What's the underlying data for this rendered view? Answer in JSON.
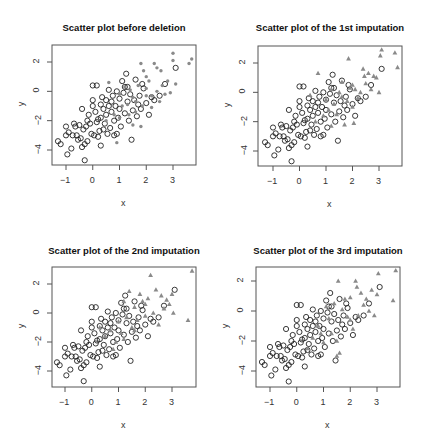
{
  "chart_data": [
    {
      "type": "scatter",
      "title": "Scatter plot before deletion",
      "xlabel": "x",
      "ylabel": "y",
      "xlim": [
        -1.4,
        3.9
      ],
      "ylim": [
        -5.0,
        3.1
      ],
      "xticks": [
        -1,
        0,
        1,
        2,
        3
      ],
      "yticks": [
        2,
        0,
        -2,
        -4
      ],
      "grid": false,
      "series": [
        {
          "name": "observed",
          "marker": "open-circle",
          "color": "#222222",
          "points": [
            [
              -1.3,
              -3.4
            ],
            [
              -1.2,
              -3.6
            ],
            [
              -1.0,
              -2.4
            ],
            [
              -1.0,
              -3.0
            ],
            [
              -0.9,
              -2.8
            ],
            [
              -0.95,
              -4.3
            ],
            [
              -0.8,
              -3.9
            ],
            [
              -0.75,
              -3.0
            ],
            [
              -0.7,
              -2.2
            ],
            [
              -0.65,
              -2.4
            ],
            [
              -0.6,
              -3.0
            ],
            [
              -0.55,
              -3.3
            ],
            [
              -0.5,
              -2.3
            ],
            [
              -0.45,
              -3.2
            ],
            [
              -0.4,
              -3.8
            ],
            [
              -0.4,
              -1.2
            ],
            [
              -0.35,
              -2.6
            ],
            [
              -0.3,
              -3.6
            ],
            [
              -0.3,
              -4.7
            ],
            [
              -0.25,
              -2.4
            ],
            [
              -0.2,
              -3.4
            ],
            [
              -0.15,
              -1.6
            ],
            [
              -0.1,
              -2.2
            ],
            [
              -0.05,
              -2.9
            ],
            [
              0.0,
              -0.6
            ],
            [
              0.0,
              -1.0
            ],
            [
              0.0,
              0.4
            ],
            [
              0.05,
              -3.0
            ],
            [
              0.1,
              -1.4
            ],
            [
              0.15,
              -2.1
            ],
            [
              0.15,
              0.4
            ],
            [
              0.2,
              -3.1
            ],
            [
              0.25,
              -2.7
            ],
            [
              0.3,
              -1.8
            ],
            [
              0.3,
              -0.9
            ],
            [
              0.3,
              -3.7
            ],
            [
              0.35,
              -0.4
            ],
            [
              0.4,
              -1.2
            ],
            [
              0.45,
              -2.2
            ],
            [
              0.5,
              -0.6
            ],
            [
              0.5,
              -1.6
            ],
            [
              0.55,
              -2.9
            ],
            [
              0.6,
              -1.0
            ],
            [
              0.6,
              0.1
            ],
            [
              0.65,
              -2.5
            ],
            [
              0.7,
              -1.4
            ],
            [
              0.75,
              -0.3
            ],
            [
              0.8,
              -2.0
            ],
            [
              0.85,
              -1.0
            ],
            [
              0.9,
              -2.9
            ],
            [
              0.9,
              0.0
            ],
            [
              0.95,
              -1.8
            ],
            [
              1.0,
              -0.5
            ],
            [
              1.0,
              -1.2
            ],
            [
              1.05,
              -2.4
            ],
            [
              1.1,
              0.7
            ],
            [
              1.15,
              -0.1
            ],
            [
              1.2,
              -1.5
            ],
            [
              1.25,
              1.2
            ],
            [
              1.3,
              -0.7
            ],
            [
              1.3,
              0.3
            ],
            [
              1.35,
              -2.0
            ],
            [
              1.4,
              -0.2
            ],
            [
              1.45,
              -3.3
            ],
            [
              1.5,
              -1.3
            ],
            [
              1.55,
              -0.6
            ],
            [
              1.6,
              0.8
            ],
            [
              1.65,
              -1.7
            ],
            [
              1.7,
              -0.9
            ],
            [
              1.75,
              -0.3
            ],
            [
              1.8,
              -1.2
            ],
            [
              1.85,
              0.5
            ],
            [
              1.9,
              0.2
            ],
            [
              2.0,
              -0.8
            ],
            [
              2.1,
              -1.6
            ],
            [
              2.2,
              -0.4
            ],
            [
              2.3,
              -0.6
            ],
            [
              2.5,
              -0.3
            ],
            [
              2.7,
              0.5
            ],
            [
              3.1,
              1.6
            ],
            [
              1.2,
              0.3
            ],
            [
              0.7,
              -0.7
            ],
            [
              0.2,
              -1.9
            ],
            [
              -0.2,
              -2.0
            ],
            [
              0.4,
              -2.6
            ],
            [
              0.8,
              -3.0
            ]
          ]
        },
        {
          "name": "deleted",
          "marker": "filled-dot",
          "color": "#8a8a8a",
          "points": [
            [
              0.6,
              0.6
            ],
            [
              0.8,
              -1.6
            ],
            [
              0.9,
              -3.5
            ],
            [
              1.0,
              -0.2
            ],
            [
              1.1,
              -1.0
            ],
            [
              1.2,
              0.3
            ],
            [
              1.3,
              -0.9
            ],
            [
              1.35,
              -1.6
            ],
            [
              1.4,
              0.1
            ],
            [
              1.5,
              -0.4
            ],
            [
              1.5,
              -2.3
            ],
            [
              1.6,
              -0.7
            ],
            [
              1.7,
              0.4
            ],
            [
              1.8,
              1.9
            ],
            [
              1.8,
              -2.4
            ],
            [
              1.85,
              -1.0
            ],
            [
              1.9,
              1.4
            ],
            [
              2.0,
              1.0
            ],
            [
              2.0,
              -0.3
            ],
            [
              2.1,
              0.7
            ],
            [
              2.2,
              -1.1
            ],
            [
              2.3,
              1.9
            ],
            [
              2.4,
              1.6
            ],
            [
              2.4,
              0.0
            ],
            [
              2.5,
              -0.7
            ],
            [
              2.55,
              1.4
            ],
            [
              2.6,
              0.4
            ],
            [
              2.7,
              -0.2
            ],
            [
              2.8,
              0.7
            ],
            [
              2.9,
              -0.1
            ],
            [
              3.0,
              2.6
            ],
            [
              3.0,
              2.1
            ],
            [
              3.1,
              0.5
            ],
            [
              3.6,
              1.9
            ],
            [
              3.7,
              2.2
            ],
            [
              2.2,
              -0.3
            ],
            [
              1.6,
              -1.4
            ],
            [
              1.0,
              -1.8
            ],
            [
              0.5,
              -2.0
            ],
            [
              2.0,
              0.2
            ]
          ]
        }
      ]
    },
    {
      "type": "scatter",
      "title": "Scatter plot of the 1st imputation",
      "xlabel": "x",
      "ylabel": "y",
      "xlim": [
        -1.4,
        3.9
      ],
      "ylim": [
        -5.0,
        3.1
      ],
      "xticks": [
        -1,
        0,
        1,
        2,
        3
      ],
      "yticks": [
        2,
        0,
        -2,
        -4
      ],
      "grid": false,
      "series": [
        {
          "name": "observed",
          "marker": "open-circle",
          "color": "#222222",
          "points_ref": "observed"
        },
        {
          "name": "imputed",
          "marker": "triangle",
          "color": "#8a8a8a",
          "points": [
            [
              0.7,
              1.3
            ],
            [
              1.0,
              -0.5
            ],
            [
              1.1,
              -1.2
            ],
            [
              1.2,
              0.2
            ],
            [
              1.3,
              -0.8
            ],
            [
              1.4,
              -1.5
            ],
            [
              1.5,
              0.0
            ],
            [
              1.6,
              -0.3
            ],
            [
              1.7,
              -2.2
            ],
            [
              1.8,
              -0.6
            ],
            [
              1.85,
              2.3
            ],
            [
              1.9,
              0.3
            ],
            [
              2.0,
              -1.0
            ],
            [
              2.05,
              -2.1
            ],
            [
              2.1,
              0.2
            ],
            [
              2.2,
              -0.4
            ],
            [
              2.3,
              0.0
            ],
            [
              2.4,
              1.6
            ],
            [
              2.45,
              1.1
            ],
            [
              2.5,
              0.6
            ],
            [
              2.6,
              1.3
            ],
            [
              2.7,
              0.2
            ],
            [
              2.8,
              1.1
            ],
            [
              2.9,
              1.0
            ],
            [
              3.0,
              0.0
            ],
            [
              3.05,
              2.5
            ],
            [
              3.1,
              2.9
            ],
            [
              3.6,
              2.7
            ],
            [
              3.7,
              1.7
            ],
            [
              0.9,
              -1.6
            ],
            [
              0.6,
              -2.0
            ],
            [
              1.2,
              -2.3
            ],
            [
              0.4,
              -0.2
            ],
            [
              1.6,
              0.7
            ],
            [
              2.0,
              0.5
            ]
          ]
        }
      ]
    },
    {
      "type": "scatter",
      "title": "Scatter plot of the 2nd imputation",
      "xlabel": "x",
      "ylabel": "y",
      "xlim": [
        -1.4,
        3.9
      ],
      "ylim": [
        -5.0,
        3.1
      ],
      "xticks": [
        -1,
        0,
        1,
        2,
        3
      ],
      "yticks": [
        2,
        0,
        -2,
        -4
      ],
      "grid": false,
      "series": [
        {
          "name": "observed",
          "marker": "open-circle",
          "color": "#222222",
          "points_ref": "observed"
        },
        {
          "name": "imputed",
          "marker": "triangle",
          "color": "#8a8a8a",
          "points": [
            [
              0.5,
              -1.6
            ],
            [
              0.7,
              -1.2
            ],
            [
              0.9,
              -2.0
            ],
            [
              1.0,
              -0.6
            ],
            [
              1.1,
              -1.4
            ],
            [
              1.2,
              0.8
            ],
            [
              1.3,
              -0.3
            ],
            [
              1.4,
              1.5
            ],
            [
              1.5,
              -1.0
            ],
            [
              1.6,
              0.4
            ],
            [
              1.7,
              -0.5
            ],
            [
              1.8,
              1.3
            ],
            [
              1.9,
              0.8
            ],
            [
              2.0,
              -0.2
            ],
            [
              2.1,
              1.0
            ],
            [
              2.2,
              2.6
            ],
            [
              2.3,
              0.0
            ],
            [
              2.4,
              1.6
            ],
            [
              2.5,
              -0.8
            ],
            [
              2.6,
              1.2
            ],
            [
              2.7,
              0.3
            ],
            [
              2.8,
              0.9
            ],
            [
              2.9,
              0.6
            ],
            [
              3.0,
              1.3
            ],
            [
              3.05,
              0.0
            ],
            [
              3.6,
              -0.5
            ],
            [
              3.75,
              2.9
            ],
            [
              1.2,
              -1.8
            ],
            [
              0.8,
              -2.5
            ],
            [
              1.6,
              -1.2
            ],
            [
              2.0,
              0.6
            ],
            [
              0.3,
              -1.0
            ]
          ]
        }
      ]
    },
    {
      "type": "scatter",
      "title": "Scatter plot of the 3rd imputation",
      "xlabel": "x",
      "ylabel": "y",
      "xlim": [
        -1.4,
        3.9
      ],
      "ylim": [
        -5.0,
        3.1
      ],
      "xticks": [
        -1,
        0,
        1,
        2,
        3
      ],
      "yticks": [
        2,
        0,
        -2,
        -4
      ],
      "grid": false,
      "series": [
        {
          "name": "observed",
          "marker": "open-circle",
          "color": "#222222",
          "points_ref": "observed"
        },
        {
          "name": "imputed",
          "marker": "triangle",
          "color": "#8a8a8a",
          "points": [
            [
              0.4,
              -2.5
            ],
            [
              0.6,
              -1.8
            ],
            [
              0.8,
              -1.0
            ],
            [
              1.0,
              -2.1
            ],
            [
              1.1,
              0.3
            ],
            [
              1.2,
              -0.5
            ],
            [
              1.3,
              -1.5
            ],
            [
              1.4,
              0.5
            ],
            [
              1.5,
              -2.0
            ],
            [
              1.55,
              2.0
            ],
            [
              1.6,
              -2.8
            ],
            [
              1.7,
              0.1
            ],
            [
              1.8,
              0.8
            ],
            [
              1.9,
              -0.4
            ],
            [
              2.0,
              0.9
            ],
            [
              2.1,
              -1.2
            ],
            [
              2.2,
              2.0
            ],
            [
              2.25,
              1.6
            ],
            [
              2.3,
              -0.3
            ],
            [
              2.4,
              1.2
            ],
            [
              2.5,
              0.4
            ],
            [
              2.6,
              0.8
            ],
            [
              2.7,
              0.0
            ],
            [
              2.8,
              1.4
            ],
            [
              2.9,
              -0.3
            ],
            [
              3.0,
              1.1
            ],
            [
              3.05,
              2.5
            ],
            [
              3.6,
              0.7
            ],
            [
              3.7,
              2.7
            ],
            [
              1.5,
              -3.0
            ],
            [
              0.9,
              -1.5
            ],
            [
              2.0,
              -0.6
            ]
          ]
        }
      ]
    }
  ],
  "panels": [
    {
      "title": "Scatter plot before deletion",
      "xlabel": "x",
      "ylabel": "y"
    },
    {
      "title": "Scatter plot of the 1st imputation",
      "xlabel": "x",
      "ylabel": "y"
    },
    {
      "title": "Scatter plot of the 2nd imputation",
      "xlabel": "x",
      "ylabel": "y"
    },
    {
      "title": "Scatter plot of the 3rd imputation",
      "xlabel": "x",
      "ylabel": "y"
    }
  ],
  "tick_labels": {
    "x": [
      "-1",
      "0",
      "1",
      "2",
      "3"
    ],
    "y": [
      "2",
      "0",
      "-2",
      "-4"
    ]
  },
  "colors": {
    "observed": "#222222",
    "imputed": "#8a8a8a",
    "axis": "#555555"
  }
}
